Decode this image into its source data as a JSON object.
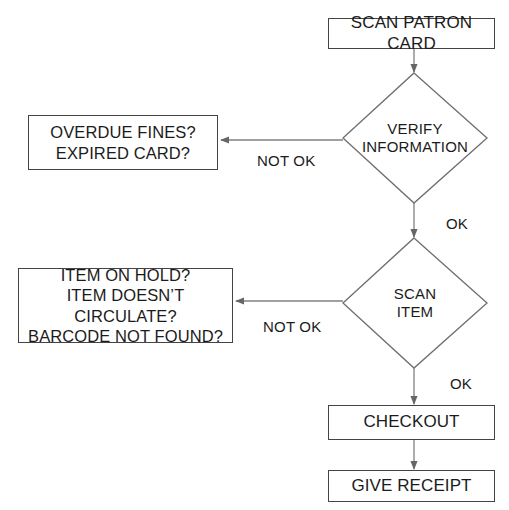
{
  "diagram": {
    "background": "#ffffff",
    "stroke_color": "#444444",
    "text_color": "#1b1b1b"
  },
  "nodes": {
    "scan_patron_card": {
      "type": "process",
      "label": "SCAN PATRON CARD"
    },
    "verify_information": {
      "type": "decision",
      "line1": "VERIFY",
      "line2": "INFORMATION"
    },
    "patron_problems": {
      "type": "process",
      "line1": "OVERDUE FINES?",
      "line2": "EXPIRED CARD?"
    },
    "scan_item": {
      "type": "decision",
      "line1": "SCAN",
      "line2": "ITEM"
    },
    "item_problems": {
      "type": "process",
      "line1": "ITEM ON HOLD?",
      "line2": "ITEM DOESN’T CIRCULATE?",
      "line3": "BARCODE NOT FOUND?"
    },
    "checkout": {
      "type": "process",
      "label": "CHECKOUT"
    },
    "give_receipt": {
      "type": "process",
      "label": "GIVE RECEIPT"
    }
  },
  "edge_labels": {
    "verify_not_ok": "NOT OK",
    "verify_ok": "OK",
    "scan_item_not_ok": "NOT OK",
    "scan_item_ok": "OK"
  }
}
